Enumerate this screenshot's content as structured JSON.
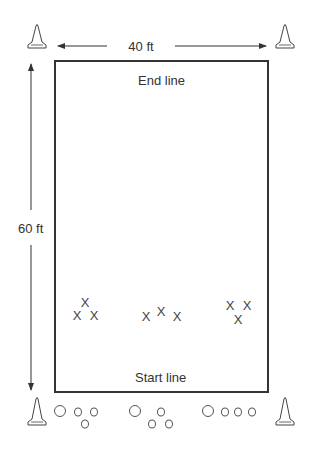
{
  "diagram": {
    "width_label": "40 ft",
    "length_label": "60 ft",
    "end_line_label": "End line",
    "start_line_label": "Start line",
    "colors": {
      "line": "#333333",
      "cone_fill": "#ffffff"
    },
    "cones": [
      {
        "name": "top-left",
        "x": 37,
        "y": 37
      },
      {
        "name": "top-right",
        "x": 285,
        "y": 37
      },
      {
        "name": "bottom-left",
        "x": 37,
        "y": 410
      },
      {
        "name": "bottom-right",
        "x": 285,
        "y": 410
      }
    ],
    "players_symbol": "X",
    "player_groups": [
      {
        "group": "left",
        "positions": [
          [
            85,
            302
          ],
          [
            77,
            315
          ],
          [
            94,
            315
          ]
        ]
      },
      {
        "group": "middle",
        "positions": [
          [
            146,
            316
          ],
          [
            161,
            310
          ],
          [
            177,
            316
          ]
        ]
      },
      {
        "group": "right",
        "positions": [
          [
            230,
            305
          ],
          [
            247,
            305
          ],
          [
            238,
            319
          ]
        ]
      }
    ],
    "ball_groups": [
      {
        "group": "left",
        "balls": [
          [
            60,
            411,
            12
          ],
          [
            78,
            412,
            8
          ],
          [
            94,
            412,
            8
          ],
          [
            85,
            424,
            8
          ]
        ]
      },
      {
        "group": "middle",
        "balls": [
          [
            135,
            411,
            12
          ],
          [
            161,
            412,
            8
          ],
          [
            152,
            424,
            8
          ],
          [
            169,
            424,
            8
          ]
        ]
      },
      {
        "group": "right",
        "balls": [
          [
            208,
            411,
            12
          ],
          [
            225,
            412,
            8
          ],
          [
            238,
            412,
            8
          ],
          [
            252,
            412,
            8
          ]
        ]
      }
    ]
  }
}
